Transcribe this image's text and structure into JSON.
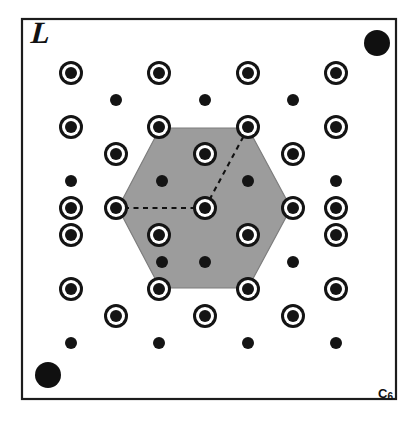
{
  "figure": {
    "lattice_label": "L",
    "symmetry_label_base": "C",
    "symmetry_label_sub": "6",
    "symmetry_label_full": "C6",
    "width": 418,
    "height": 422,
    "background_color": "#ffffff"
  },
  "frame": {
    "x": 22,
    "y": 19,
    "width": 374,
    "height": 380,
    "stroke_color": "#1c1c1c",
    "stroke_width": 2.2
  },
  "hexagon": {
    "fill_color": "#9c9c9c",
    "stroke_color": "#7d7d7d",
    "center": [
      205,
      208
    ],
    "points": [
      [
        160,
        128
      ],
      [
        248,
        128
      ],
      [
        291,
        208
      ],
      [
        248,
        288
      ],
      [
        160,
        288
      ],
      [
        118,
        208
      ]
    ]
  },
  "dashed_lines": [
    {
      "name": "a1-vector",
      "from": [
        205,
        208
      ],
      "to": [
        118,
        208
      ],
      "color": "#111111"
    },
    {
      "name": "a2-vector",
      "from": [
        205,
        208
      ],
      "to": [
        248,
        128
      ],
      "color": "#111111"
    }
  ],
  "corner_dots": [
    {
      "name": "top-right-corner-dot",
      "cx": 377,
      "cy": 43,
      "r": 13,
      "color": "#101010"
    },
    {
      "name": "bottom-left-corner-dot",
      "cx": 48,
      "cy": 375,
      "r": 13,
      "color": "#101010"
    }
  ],
  "ringed_dots": {
    "outer_radius": 12,
    "gap_radius": 9,
    "core_radius": 6,
    "color": "#141414",
    "positions": [
      [
        71,
        73
      ],
      [
        159,
        73
      ],
      [
        248,
        73
      ],
      [
        336,
        73
      ],
      [
        71,
        127
      ],
      [
        159,
        127
      ],
      [
        248,
        127
      ],
      [
        336,
        127
      ],
      [
        116,
        154
      ],
      [
        205,
        154
      ],
      [
        293,
        154
      ],
      [
        71,
        208
      ],
      [
        116,
        208
      ],
      [
        205,
        208
      ],
      [
        293,
        208
      ],
      [
        336,
        208
      ],
      [
        71,
        235
      ],
      [
        159,
        235
      ],
      [
        248,
        235
      ],
      [
        336,
        235
      ],
      [
        71,
        289
      ],
      [
        159,
        289
      ],
      [
        248,
        289
      ],
      [
        336,
        289
      ],
      [
        116,
        316
      ],
      [
        205,
        316
      ],
      [
        293,
        316
      ]
    ]
  },
  "plain_dots": {
    "radius": 6,
    "color": "#141414",
    "positions": [
      [
        116,
        100
      ],
      [
        205,
        100
      ],
      [
        293,
        100
      ],
      [
        162,
        181
      ],
      [
        248,
        181
      ],
      [
        71,
        181
      ],
      [
        336,
        181
      ],
      [
        162,
        262
      ],
      [
        205,
        262
      ],
      [
        293,
        262
      ],
      [
        71,
        343
      ],
      [
        159,
        343
      ],
      [
        248,
        343
      ],
      [
        336,
        343
      ]
    ]
  },
  "chart_data": {
    "type": "scatter",
    "xlabel": "",
    "ylabel": "",
    "legend": [
      {
        "name": "ringed-lattice-point",
        "description": "lattice point drawn as a filled dot inside an open ring"
      },
      {
        "name": "plain-lattice-point",
        "description": "lattice point drawn as a small filled dot"
      },
      {
        "name": "corner-marker",
        "description": "large filled dot in frame corner"
      }
    ],
    "annotations": [
      "L",
      "C6"
    ]
  }
}
